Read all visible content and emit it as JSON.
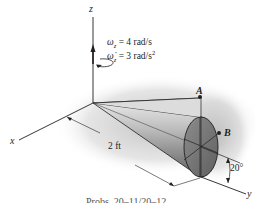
{
  "figure": {
    "type": "engineering-mechanics-diagram",
    "axes": {
      "x": "x",
      "y": "y",
      "z": "z"
    },
    "angular_velocity": {
      "symbol": "ω",
      "subscript": "z",
      "value": "4",
      "unit": "rad/s",
      "text": "= 4 rad/s"
    },
    "angular_acceleration": {
      "symbol": "ω̇",
      "subscript": "z",
      "value": "3",
      "unit": "rad/s²",
      "text": "= 3 rad/s",
      "superscript": "2"
    },
    "points": {
      "A": "A",
      "B": "B"
    },
    "dimensions": {
      "length": "2 ft",
      "angle": "20°"
    },
    "caption": "Probs. 20–11/20–12",
    "colors": {
      "line": "#231f20",
      "cone_light": "#d9d9d9",
      "cone_dark": "#6b6b6b",
      "base_fill": "#7a7a7a",
      "shadow": "#c8c8c8"
    }
  }
}
